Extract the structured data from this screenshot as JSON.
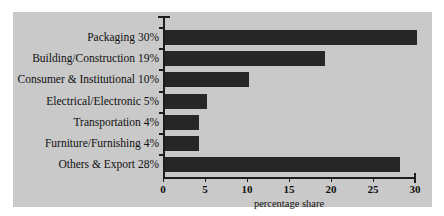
{
  "chart_data": {
    "type": "bar",
    "orientation": "horizontal",
    "title": "",
    "xlabel": "percentage share",
    "ylabel": "",
    "xlim": [
      0,
      30
    ],
    "xticks": [
      0,
      5,
      10,
      15,
      20,
      25,
      30
    ],
    "xticklabels": [
      "0",
      "5",
      "10",
      "15",
      "20",
      "25",
      "30"
    ],
    "grid": false,
    "legend": false,
    "categories": [
      "Packaging 30%",
      "Building/Construction 19%",
      "Consumer & Institutional 10%",
      "Electrical/Electronic 5%",
      "Transportation 4%",
      "Furniture/Furnishing 4%",
      "Others & Export 28%"
    ],
    "values": [
      30,
      19,
      10,
      5,
      4,
      4,
      28
    ],
    "bar_color": "#262626",
    "panel_color": "#c9c9c9",
    "axis_color": "#1d1d1d"
  }
}
